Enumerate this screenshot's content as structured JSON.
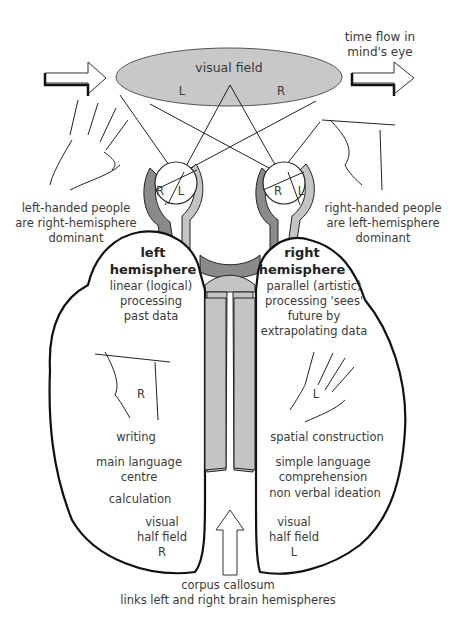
{
  "visual_field": {
    "label": "visual field",
    "left_label": "L",
    "right_label": "R"
  },
  "time_flow": {
    "lines": [
      "time flow in",
      "mind's eye"
    ]
  },
  "eyes": {
    "left_eye": {
      "r": "R",
      "l": "L"
    },
    "right_eye": {
      "r": "R",
      "l": "L"
    }
  },
  "handedness": {
    "left": [
      "left-handed people",
      "are right-hemisphere",
      "dominant"
    ],
    "right": [
      "right-handed people",
      "are left-hemisphere",
      "dominant"
    ]
  },
  "left_hemisphere": {
    "title": [
      "left",
      "hemisphere"
    ],
    "description": [
      "linear (logical)",
      "processing",
      "past data"
    ],
    "hand_label": "R",
    "functions": [
      "writing",
      "main language",
      "centre",
      "calculation"
    ],
    "visual_half_field": [
      "visual",
      "half field",
      "R"
    ]
  },
  "right_hemisphere": {
    "title": [
      "right",
      "hemisphere"
    ],
    "description": [
      "parallel (artistic)",
      "processing 'sees'",
      "future by",
      "extrapolating data"
    ],
    "hand_label": "L",
    "functions": [
      "spatial construction",
      "simple language",
      "comprehension",
      "non verbal ideation"
    ],
    "visual_half_field": [
      "visual",
      "half field",
      "L"
    ]
  },
  "corpus_callosum": {
    "lines": [
      "corpus callosum",
      "links left and right brain hemispheres"
    ]
  },
  "colors": {
    "field_fill": "#c8c8c8",
    "nerve_dark": "#8a8a8a",
    "nerve_light": "#c4c4c4",
    "outline": "#111111"
  }
}
